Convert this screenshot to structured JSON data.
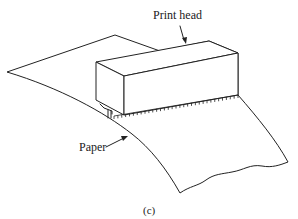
{
  "figure": {
    "type": "line-drawing",
    "labels": {
      "print_head": "Print head",
      "paper": "Paper"
    },
    "caption": "(c)",
    "colors": {
      "stroke": "#222222",
      "background": "#ffffff"
    }
  }
}
